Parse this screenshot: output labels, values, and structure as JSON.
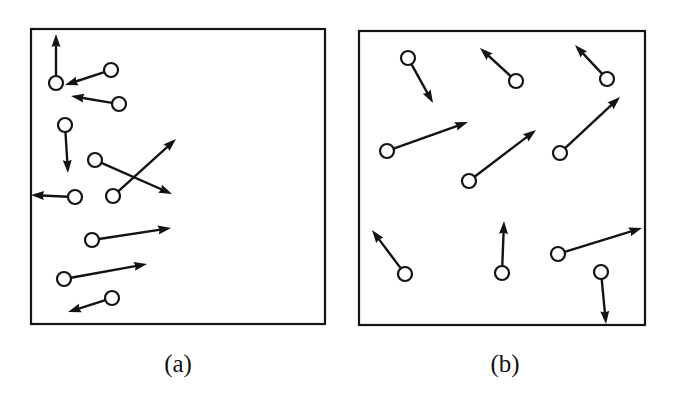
{
  "figure": {
    "background_color": "#ffffff",
    "ink_color": "#131313",
    "width": 676,
    "height": 399
  },
  "chart_data": {
    "type": "scatter",
    "title": "",
    "xlabel": "",
    "ylabel": "",
    "grid": false,
    "legend_position": "none",
    "panels": [
      {
        "id": "a",
        "caption": "(a)",
        "caption_x": 178,
        "caption_y": 372,
        "frame": {
          "x": 31,
          "y": 29,
          "width": 294,
          "height": 295
        },
        "frame_stroke_width": 2.2,
        "particle_radius": 7.0,
        "particle_stroke_width": 2.2,
        "vector_stroke_width": 2.4,
        "arrow_head_length": 13,
        "arrow_head_width": 9,
        "particles": [
          {
            "id": "a1",
            "cx": 56,
            "cy": 83,
            "vx": 0,
            "vy": -49
          },
          {
            "id": "a2",
            "cx": 111,
            "cy": 70,
            "vx": -46,
            "vy": 15
          },
          {
            "id": "a3",
            "cx": 119,
            "cy": 104,
            "vx": -48,
            "vy": -8
          },
          {
            "id": "a4",
            "cx": 65,
            "cy": 125,
            "vx": 3,
            "vy": 48
          },
          {
            "id": "a5",
            "cx": 95,
            "cy": 160,
            "vx": 77,
            "vy": 34
          },
          {
            "id": "a6",
            "cx": 113,
            "cy": 196,
            "vx": 63,
            "vy": -57
          },
          {
            "id": "a7",
            "cx": 75,
            "cy": 197,
            "vx": -44,
            "vy": -2
          },
          {
            "id": "a8",
            "cx": 92,
            "cy": 240,
            "vx": 79,
            "vy": -12
          },
          {
            "id": "a9",
            "cx": 64,
            "cy": 279,
            "vx": 83,
            "vy": -15
          },
          {
            "id": "a10",
            "cx": 112,
            "cy": 298,
            "vx": -44,
            "vy": 14
          }
        ]
      },
      {
        "id": "b",
        "caption": "(b)",
        "caption_x": 505,
        "caption_y": 372,
        "frame": {
          "x": 359,
          "y": 31,
          "width": 286,
          "height": 294
        },
        "frame_stroke_width": 2.2,
        "particle_radius": 7.0,
        "particle_stroke_width": 2.2,
        "vector_stroke_width": 2.4,
        "arrow_head_length": 13,
        "arrow_head_width": 9,
        "particles": [
          {
            "id": "b1",
            "cx": 408,
            "cy": 58,
            "vx": 25,
            "vy": 45
          },
          {
            "id": "b2",
            "cx": 516,
            "cy": 81,
            "vx": -36,
            "vy": -33
          },
          {
            "id": "b3",
            "cx": 607,
            "cy": 79,
            "vx": -32,
            "vy": -34
          },
          {
            "id": "b4",
            "cx": 387,
            "cy": 151,
            "vx": 81,
            "vy": -29
          },
          {
            "id": "b5",
            "cx": 469,
            "cy": 181,
            "vx": 67,
            "vy": -51
          },
          {
            "id": "b6",
            "cx": 560,
            "cy": 153,
            "vx": 60,
            "vy": -56
          },
          {
            "id": "b7",
            "cx": 405,
            "cy": 274,
            "vx": -33,
            "vy": -44
          },
          {
            "id": "b8",
            "cx": 502,
            "cy": 273,
            "vx": 2,
            "vy": -52
          },
          {
            "id": "b9",
            "cx": 558,
            "cy": 254,
            "vx": 84,
            "vy": -26
          },
          {
            "id": "b10",
            "cx": 601,
            "cy": 272,
            "vx": 5,
            "vy": 52
          }
        ]
      }
    ]
  }
}
